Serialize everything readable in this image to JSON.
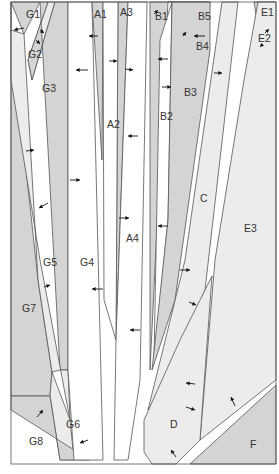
{
  "colors": {
    "dark": "#d4d4d4",
    "mid": "#e2e2e2",
    "light": "#ececec",
    "white": "#ffffff",
    "stroke": "#555555"
  },
  "regions": [
    {
      "id": "G1",
      "fill": "dark",
      "points": "11,2 40,2 24,34"
    },
    {
      "id": "G2",
      "fill": "light",
      "points": "48,2 55,2 32,80 28,60"
    },
    {
      "id": "G3",
      "fill": "dark",
      "points": "40,2 48,2 28,60 32,80 55,2 68,2 68,370 60,370"
    },
    {
      "id": "G7",
      "fill": "dark",
      "points": "11,2 11,396 50,396 52,372 38,280 11,30"
    },
    {
      "id": "G5",
      "fill": "light",
      "points": "11,30 24,34 38,280 52,372 60,370 68,370 70,420 40,260 11,80"
    },
    {
      "id": "G6",
      "fill": "light",
      "points": "50,396 52,372 70,420 74,460 60,460"
    },
    {
      "id": "G8",
      "fill": "dark",
      "points": "11,396 50,396 60,460 90,460 11,410"
    },
    {
      "id": "G4",
      "fill": "white",
      "points": "68,2 92,2 103,460 74,460 68,370"
    },
    {
      "id": "A1",
      "fill": "dark",
      "points": "92,2 103,2 102,160"
    },
    {
      "id": "A3",
      "fill": "dark",
      "points": "118,2 128,2 116,340"
    },
    {
      "id": "A2",
      "fill": "white",
      "points": "103,2 118,2 116,340 104,300"
    },
    {
      "id": "A4",
      "fill": "white",
      "points": "128,2 147,2 140,380 128,460 114,460 116,340"
    },
    {
      "id": "B1",
      "fill": "dark",
      "points": "150,2 168,2 150,370"
    },
    {
      "id": "B5",
      "fill": "dark",
      "points": "172,2 208,2 190,62"
    },
    {
      "id": "B4",
      "fill": "light",
      "points": "168,2 172,2 190,62 207,46 210,2"
    },
    {
      "id": "B2",
      "fill": "white",
      "points": "160,40 172,2 168,220 154,360"
    },
    {
      "id": "B3",
      "fill": "dark",
      "points": "172,2 210,2 210,50 175,300 152,370 168,220"
    },
    {
      "id": "C",
      "fill": "light",
      "points": "222,2 238,2 205,290 170,380 148,410 185,260"
    },
    {
      "id": "E1",
      "fill": "dark",
      "points": "254,2 276,2 260,40"
    },
    {
      "id": "E2",
      "fill": "light",
      "points": "270,14 276,28 252,60"
    },
    {
      "id": "E3",
      "fill": "light",
      "points": "258,2 276,2 276,380 200,440 215,260 244,80"
    },
    {
      "id": "D",
      "fill": "light",
      "points": "212,276 200,440 176,464 152,464 144,452 144,420 180,340"
    },
    {
      "id": "F",
      "fill": "dark",
      "points": "276,385 276,464 190,464"
    }
  ],
  "labels": [
    {
      "text": "G1",
      "x": 26,
      "y": 18
    },
    {
      "text": "G2",
      "x": 28,
      "y": 58
    },
    {
      "text": "G3",
      "x": 42,
      "y": 92
    },
    {
      "text": "G4",
      "x": 80,
      "y": 266
    },
    {
      "text": "G5",
      "x": 43,
      "y": 266
    },
    {
      "text": "G6",
      "x": 66,
      "y": 428
    },
    {
      "text": "G7",
      "x": 22,
      "y": 312
    },
    {
      "text": "G8",
      "x": 29,
      "y": 445
    },
    {
      "text": "A1",
      "x": 94,
      "y": 18
    },
    {
      "text": "A2",
      "x": 107,
      "y": 128
    },
    {
      "text": "A3",
      "x": 120,
      "y": 16
    },
    {
      "text": "A4",
      "x": 126,
      "y": 242
    },
    {
      "text": "B1",
      "x": 155,
      "y": 20
    },
    {
      "text": "B2",
      "x": 160,
      "y": 120
    },
    {
      "text": "B3",
      "x": 184,
      "y": 96
    },
    {
      "text": "B4",
      "x": 196,
      "y": 50
    },
    {
      "text": "B5",
      "x": 198,
      "y": 20
    },
    {
      "text": "C",
      "x": 200,
      "y": 202
    },
    {
      "text": "D",
      "x": 170,
      "y": 428
    },
    {
      "text": "E1",
      "x": 261,
      "y": 16
    },
    {
      "text": "E2",
      "x": 258,
      "y": 42
    },
    {
      "text": "E3",
      "x": 244,
      "y": 232
    },
    {
      "text": "F",
      "x": 250,
      "y": 448
    }
  ],
  "arrows": [
    {
      "x1": 24,
      "y1": 28,
      "x2": 14,
      "y2": 30
    },
    {
      "x1": 40,
      "y1": 30,
      "x2": 44,
      "y2": 33
    },
    {
      "x1": 36,
      "y1": 40,
      "x2": 40,
      "y2": 44
    },
    {
      "x1": 88,
      "y1": 70,
      "x2": 76,
      "y2": 70
    },
    {
      "x1": 26,
      "y1": 151,
      "x2": 34,
      "y2": 150
    },
    {
      "x1": 70,
      "y1": 180,
      "x2": 80,
      "y2": 180
    },
    {
      "x1": 48,
      "y1": 203,
      "x2": 39,
      "y2": 208
    },
    {
      "x1": 44,
      "y1": 287,
      "x2": 50,
      "y2": 285
    },
    {
      "x1": 103,
      "y1": 289,
      "x2": 92,
      "y2": 289
    },
    {
      "x1": 37,
      "y1": 417,
      "x2": 43,
      "y2": 410
    },
    {
      "x1": 88,
      "y1": 440,
      "x2": 80,
      "y2": 443
    },
    {
      "x1": 98,
      "y1": 36,
      "x2": 89,
      "y2": 36
    },
    {
      "x1": 109,
      "y1": 61,
      "x2": 117,
      "y2": 61
    },
    {
      "x1": 125,
      "y1": 69,
      "x2": 133,
      "y2": 70
    },
    {
      "x1": 138,
      "y1": 136,
      "x2": 128,
      "y2": 136
    },
    {
      "x1": 119,
      "y1": 218,
      "x2": 129,
      "y2": 218
    },
    {
      "x1": 140,
      "y1": 330,
      "x2": 130,
      "y2": 330
    },
    {
      "x1": 168,
      "y1": 59,
      "x2": 158,
      "y2": 59
    },
    {
      "x1": 162,
      "y1": 87,
      "x2": 171,
      "y2": 87
    },
    {
      "x1": 168,
      "y1": 226,
      "x2": 158,
      "y2": 226
    },
    {
      "x1": 154,
      "y1": 14,
      "x2": 158,
      "y2": 10
    },
    {
      "x1": 183,
      "y1": 36,
      "x2": 186,
      "y2": 32
    },
    {
      "x1": 205,
      "y1": 36,
      "x2": 194,
      "y2": 36
    },
    {
      "x1": 214,
      "y1": 73,
      "x2": 222,
      "y2": 73
    },
    {
      "x1": 180,
      "y1": 270,
      "x2": 190,
      "y2": 270
    },
    {
      "x1": 189,
      "y1": 302,
      "x2": 196,
      "y2": 305
    },
    {
      "x1": 195,
      "y1": 384,
      "x2": 186,
      "y2": 383
    },
    {
      "x1": 186,
      "y1": 407,
      "x2": 195,
      "y2": 410
    },
    {
      "x1": 176,
      "y1": 457,
      "x2": 171,
      "y2": 450
    },
    {
      "x1": 235,
      "y1": 406,
      "x2": 231,
      "y2": 397
    },
    {
      "x1": 265,
      "y1": 33,
      "x2": 269,
      "y2": 29
    },
    {
      "x1": 263,
      "y1": 44,
      "x2": 260,
      "y2": 47
    }
  ],
  "frame": {
    "x": 11,
    "y": 2,
    "width": 265,
    "height": 462
  }
}
